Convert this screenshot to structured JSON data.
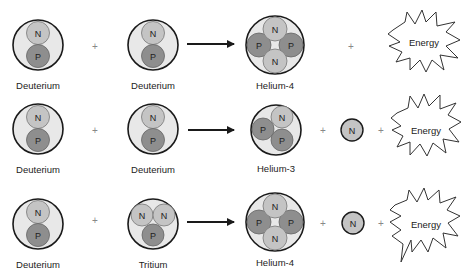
{
  "colors": {
    "nucleus_fill": "#e8e8e8",
    "neutron": "#c4c4c4",
    "proton": "#8e8e8e",
    "outline": "#1a1a1a",
    "plus": "#888888"
  },
  "particles": {
    "neutron": "N",
    "proton": "P"
  },
  "plus_sign": "+",
  "energy_label": "Energy",
  "reactions": [
    {
      "reactant_1": "Deuterium",
      "reactant_2": "Deuterium",
      "product": "Helium-4",
      "byproducts": [
        "Energy"
      ]
    },
    {
      "reactant_1": "Deuterium",
      "reactant_2": "Deuterium",
      "product": "Helium-3",
      "byproducts": [
        "N",
        "Energy"
      ]
    },
    {
      "reactant_1": "Deuterium",
      "reactant_2": "Tritium",
      "product": "Helium-4",
      "byproducts": [
        "N",
        "Energy"
      ]
    }
  ]
}
